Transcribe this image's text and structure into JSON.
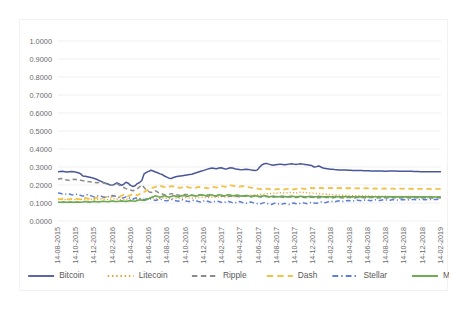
{
  "chart_data": {
    "type": "line",
    "title": "",
    "subtitle": "",
    "xlabel": "",
    "ylabel": "",
    "ylim": [
      0.0,
      1.0
    ],
    "ytick_step": 0.1,
    "grid": true,
    "legend_position": "bottom",
    "y_ticks": [
      "0.0000",
      "0.1000",
      "0.2000",
      "0.3000",
      "0.4000",
      "0.5000",
      "0.6000",
      "0.7000",
      "0.8000",
      "0.9000",
      "1.0000"
    ],
    "x_ticks": [
      "14-08-2015",
      "14-10-2015",
      "14-12-2015",
      "14-02-2016",
      "14-04-2016",
      "14-06-2016",
      "14-08-2016",
      "14-10-2016",
      "14-12-2016",
      "14-02-2017",
      "14-04-2017",
      "14-06-2017",
      "14-08-2017",
      "14-10-2017",
      "14-12-2017",
      "14-02-2018",
      "14-04-2018",
      "14-06-2018",
      "14-08-2018",
      "14-10-2018",
      "14-12-2018",
      "14-02-2019"
    ],
    "x_range": [
      "14-08-2015",
      "14-02-2019"
    ],
    "series": [
      {
        "name": "Bitcoin",
        "color": "#4a5699",
        "style": "solid",
        "width": 1.5,
        "values": [
          0.274,
          0.275,
          0.276,
          0.274,
          0.272,
          0.274,
          0.275,
          0.273,
          0.271,
          0.268,
          0.262,
          0.25,
          0.248,
          0.246,
          0.243,
          0.24,
          0.236,
          0.232,
          0.226,
          0.22,
          0.214,
          0.21,
          0.206,
          0.2,
          0.198,
          0.205,
          0.212,
          0.206,
          0.198,
          0.204,
          0.215,
          0.21,
          0.198,
          0.192,
          0.196,
          0.208,
          0.214,
          0.225,
          0.262,
          0.27,
          0.276,
          0.282,
          0.278,
          0.272,
          0.268,
          0.262,
          0.258,
          0.25,
          0.244,
          0.238,
          0.236,
          0.242,
          0.246,
          0.248,
          0.25,
          0.252,
          0.254,
          0.256,
          0.258,
          0.26,
          0.264,
          0.268,
          0.272,
          0.276,
          0.28,
          0.284,
          0.288,
          0.292,
          0.294,
          0.292,
          0.29,
          0.294,
          0.296,
          0.292,
          0.288,
          0.292,
          0.296,
          0.294,
          0.29,
          0.288,
          0.286,
          0.284,
          0.286,
          0.288,
          0.286,
          0.284,
          0.282,
          0.28,
          0.284,
          0.3,
          0.312,
          0.318,
          0.32,
          0.316,
          0.312,
          0.31,
          0.312,
          0.314,
          0.316,
          0.314,
          0.312,
          0.314,
          0.316,
          0.318,
          0.316,
          0.314,
          0.316,
          0.318,
          0.316,
          0.314,
          0.312,
          0.31,
          0.308,
          0.3,
          0.302,
          0.306,
          0.3,
          0.294,
          0.292,
          0.29,
          0.288,
          0.288,
          0.286,
          0.285,
          0.284,
          0.284,
          0.283,
          0.283,
          0.282,
          0.282,
          0.281,
          0.281,
          0.28,
          0.28,
          0.28,
          0.279,
          0.279,
          0.279,
          0.278,
          0.278,
          0.278,
          0.278,
          0.278,
          0.278,
          0.277,
          0.277,
          0.278,
          0.278,
          0.278,
          0.278,
          0.277,
          0.277,
          0.277,
          0.276,
          0.276,
          0.276,
          0.276,
          0.275,
          0.275,
          0.275,
          0.274,
          0.274,
          0.274,
          0.274,
          0.273,
          0.273,
          0.273,
          0.273,
          0.273,
          0.273
        ]
      },
      {
        "name": "Litecoin",
        "color": "#e8a33d",
        "style": "dotted",
        "width": 1.4,
        "values": [
          0.122,
          0.12,
          0.121,
          0.119,
          0.118,
          0.12,
          0.122,
          0.12,
          0.118,
          0.119,
          0.121,
          0.12,
          0.118,
          0.117,
          0.119,
          0.121,
          0.119,
          0.118,
          0.12,
          0.122,
          0.12,
          0.118,
          0.119,
          0.121,
          0.122,
          0.124,
          0.122,
          0.12,
          0.118,
          0.12,
          0.122,
          0.121,
          0.119,
          0.118,
          0.12,
          0.122,
          0.121,
          0.12,
          0.122,
          0.124,
          0.126,
          0.128,
          0.127,
          0.125,
          0.124,
          0.126,
          0.128,
          0.127,
          0.126,
          0.125,
          0.124,
          0.126,
          0.128,
          0.127,
          0.126,
          0.128,
          0.13,
          0.129,
          0.128,
          0.127,
          0.126,
          0.128,
          0.13,
          0.132,
          0.131,
          0.13,
          0.129,
          0.131,
          0.133,
          0.132,
          0.131,
          0.133,
          0.135,
          0.134,
          0.133,
          0.135,
          0.137,
          0.136,
          0.135,
          0.137,
          0.139,
          0.138,
          0.14,
          0.142,
          0.141,
          0.143,
          0.145,
          0.144,
          0.146,
          0.148,
          0.15,
          0.149,
          0.151,
          0.153,
          0.152,
          0.154,
          0.156,
          0.155,
          0.157,
          0.156,
          0.155,
          0.157,
          0.159,
          0.158,
          0.157,
          0.156,
          0.158,
          0.16,
          0.159,
          0.158,
          0.157,
          0.156,
          0.155,
          0.154,
          0.153,
          0.152,
          0.151,
          0.15,
          0.149,
          0.148,
          0.147,
          0.146,
          0.145,
          0.144,
          0.144,
          0.143,
          0.143,
          0.142,
          0.142,
          0.141,
          0.141,
          0.141,
          0.14,
          0.14,
          0.14,
          0.14,
          0.139,
          0.139,
          0.139,
          0.139,
          0.138,
          0.138,
          0.138,
          0.138,
          0.138,
          0.138,
          0.137,
          0.137,
          0.137,
          0.137,
          0.137,
          0.137,
          0.136,
          0.136,
          0.136,
          0.136,
          0.136,
          0.136,
          0.136,
          0.135,
          0.135,
          0.135,
          0.135,
          0.135,
          0.135,
          0.135,
          0.135,
          0.134,
          0.134,
          0.134
        ]
      },
      {
        "name": "Ripple",
        "color": "#8c8c8c",
        "style": "dashed",
        "width": 1.5,
        "values": [
          0.232,
          0.236,
          0.234,
          0.23,
          0.228,
          0.226,
          0.229,
          0.232,
          0.23,
          0.228,
          0.226,
          0.224,
          0.222,
          0.22,
          0.218,
          0.216,
          0.214,
          0.212,
          0.214,
          0.216,
          0.212,
          0.208,
          0.204,
          0.2,
          0.198,
          0.202,
          0.206,
          0.2,
          0.192,
          0.186,
          0.18,
          0.176,
          0.172,
          0.168,
          0.172,
          0.18,
          0.19,
          0.2,
          0.186,
          0.172,
          0.164,
          0.158,
          0.162,
          0.168,
          0.16,
          0.154,
          0.15,
          0.146,
          0.144,
          0.148,
          0.152,
          0.15,
          0.146,
          0.144,
          0.142,
          0.145,
          0.148,
          0.146,
          0.144,
          0.142,
          0.14,
          0.143,
          0.146,
          0.144,
          0.142,
          0.14,
          0.138,
          0.14,
          0.142,
          0.14,
          0.138,
          0.136,
          0.138,
          0.14,
          0.138,
          0.136,
          0.138,
          0.14,
          0.138,
          0.136,
          0.135,
          0.137,
          0.139,
          0.137,
          0.135,
          0.134,
          0.136,
          0.138,
          0.136,
          0.134,
          0.133,
          0.135,
          0.137,
          0.135,
          0.133,
          0.132,
          0.134,
          0.136,
          0.134,
          0.132,
          0.131,
          0.133,
          0.135,
          0.133,
          0.131,
          0.13,
          0.132,
          0.134,
          0.132,
          0.13,
          0.129,
          0.131,
          0.133,
          0.131,
          0.13,
          0.129,
          0.131,
          0.133,
          0.131,
          0.13,
          0.129,
          0.128,
          0.13,
          0.132,
          0.13,
          0.129,
          0.128,
          0.13,
          0.131,
          0.13,
          0.129,
          0.128,
          0.13,
          0.131,
          0.13,
          0.129,
          0.128,
          0.129,
          0.131,
          0.13,
          0.129,
          0.128,
          0.129,
          0.13,
          0.129,
          0.128,
          0.128,
          0.129,
          0.13,
          0.129,
          0.128,
          0.128,
          0.129,
          0.13,
          0.129,
          0.128,
          0.128,
          0.129,
          0.13,
          0.129,
          0.128,
          0.128,
          0.129,
          0.129,
          0.128,
          0.128,
          0.128,
          0.129,
          0.129,
          0.128
        ]
      },
      {
        "name": "Dash",
        "color": "#f0c246",
        "style": "dashed",
        "width": 1.8,
        "values": [
          0.122,
          0.12,
          0.124,
          0.126,
          0.122,
          0.12,
          0.123,
          0.126,
          0.124,
          0.122,
          0.12,
          0.124,
          0.128,
          0.126,
          0.124,
          0.122,
          0.126,
          0.13,
          0.128,
          0.126,
          0.13,
          0.134,
          0.132,
          0.13,
          0.136,
          0.142,
          0.138,
          0.134,
          0.14,
          0.146,
          0.142,
          0.138,
          0.144,
          0.15,
          0.146,
          0.142,
          0.15,
          0.158,
          0.162,
          0.168,
          0.175,
          0.182,
          0.186,
          0.19,
          0.194,
          0.196,
          0.192,
          0.188,
          0.186,
          0.19,
          0.194,
          0.192,
          0.188,
          0.186,
          0.184,
          0.188,
          0.192,
          0.19,
          0.186,
          0.184,
          0.182,
          0.186,
          0.19,
          0.188,
          0.186,
          0.184,
          0.182,
          0.186,
          0.19,
          0.188,
          0.186,
          0.19,
          0.194,
          0.192,
          0.19,
          0.194,
          0.198,
          0.196,
          0.194,
          0.192,
          0.19,
          0.194,
          0.192,
          0.19,
          0.188,
          0.186,
          0.184,
          0.182,
          0.18,
          0.178,
          0.176,
          0.178,
          0.18,
          0.178,
          0.176,
          0.174,
          0.176,
          0.178,
          0.176,
          0.174,
          0.176,
          0.178,
          0.18,
          0.178,
          0.176,
          0.178,
          0.18,
          0.182,
          0.18,
          0.178,
          0.18,
          0.182,
          0.184,
          0.182,
          0.18,
          0.182,
          0.184,
          0.182,
          0.18,
          0.182,
          0.184,
          0.182,
          0.18,
          0.182,
          0.184,
          0.182,
          0.18,
          0.182,
          0.183,
          0.182,
          0.18,
          0.181,
          0.182,
          0.181,
          0.18,
          0.181,
          0.182,
          0.181,
          0.18,
          0.18,
          0.181,
          0.18,
          0.179,
          0.18,
          0.181,
          0.18,
          0.179,
          0.18,
          0.18,
          0.179,
          0.179,
          0.18,
          0.18,
          0.179,
          0.178,
          0.179,
          0.18,
          0.179,
          0.178,
          0.178,
          0.179,
          0.178,
          0.178,
          0.178,
          0.178,
          0.177,
          0.177,
          0.178,
          0.178,
          0.177
        ]
      },
      {
        "name": "Stellar",
        "color": "#5b7fd4",
        "style": "dashdot",
        "width": 1.5,
        "values": [
          0.156,
          0.154,
          0.15,
          0.148,
          0.152,
          0.15,
          0.146,
          0.144,
          0.148,
          0.146,
          0.142,
          0.138,
          0.142,
          0.146,
          0.142,
          0.138,
          0.134,
          0.138,
          0.142,
          0.138,
          0.134,
          0.13,
          0.134,
          0.138,
          0.142,
          0.138,
          0.134,
          0.13,
          0.126,
          0.13,
          0.134,
          0.13,
          0.126,
          0.122,
          0.126,
          0.13,
          0.126,
          0.122,
          0.118,
          0.122,
          0.126,
          0.122,
          0.118,
          0.114,
          0.118,
          0.122,
          0.118,
          0.114,
          0.112,
          0.116,
          0.12,
          0.116,
          0.112,
          0.11,
          0.114,
          0.118,
          0.114,
          0.11,
          0.108,
          0.112,
          0.116,
          0.112,
          0.108,
          0.106,
          0.11,
          0.114,
          0.11,
          0.106,
          0.104,
          0.108,
          0.112,
          0.108,
          0.104,
          0.102,
          0.106,
          0.11,
          0.106,
          0.102,
          0.1,
          0.104,
          0.108,
          0.104,
          0.1,
          0.098,
          0.102,
          0.106,
          0.102,
          0.098,
          0.096,
          0.094,
          0.098,
          0.102,
          0.098,
          0.094,
          0.092,
          0.096,
          0.1,
          0.096,
          0.092,
          0.094,
          0.098,
          0.094,
          0.092,
          0.096,
          0.1,
          0.096,
          0.094,
          0.098,
          0.102,
          0.098,
          0.096,
          0.1,
          0.104,
          0.1,
          0.098,
          0.102,
          0.106,
          0.104,
          0.102,
          0.106,
          0.11,
          0.108,
          0.106,
          0.11,
          0.112,
          0.11,
          0.108,
          0.112,
          0.114,
          0.112,
          0.11,
          0.114,
          0.116,
          0.114,
          0.112,
          0.115,
          0.117,
          0.115,
          0.113,
          0.116,
          0.118,
          0.116,
          0.114,
          0.117,
          0.119,
          0.117,
          0.115,
          0.117,
          0.119,
          0.117,
          0.116,
          0.118,
          0.12,
          0.118,
          0.117,
          0.118,
          0.12,
          0.119,
          0.118,
          0.119,
          0.12,
          0.119,
          0.118,
          0.119,
          0.12,
          0.119,
          0.119,
          0.12,
          0.121,
          0.12
        ]
      },
      {
        "name": "Monero",
        "color": "#6ba84f",
        "style": "solid",
        "width": 1.6,
        "values": [
          0.105,
          0.104,
          0.106,
          0.105,
          0.104,
          0.106,
          0.105,
          0.104,
          0.106,
          0.105,
          0.104,
          0.106,
          0.108,
          0.106,
          0.105,
          0.107,
          0.109,
          0.107,
          0.106,
          0.108,
          0.11,
          0.108,
          0.107,
          0.109,
          0.111,
          0.109,
          0.108,
          0.11,
          0.112,
          0.11,
          0.109,
          0.111,
          0.113,
          0.111,
          0.11,
          0.114,
          0.118,
          0.116,
          0.114,
          0.118,
          0.124,
          0.13,
          0.134,
          0.14,
          0.136,
          0.132,
          0.136,
          0.14,
          0.136,
          0.132,
          0.136,
          0.14,
          0.138,
          0.134,
          0.138,
          0.142,
          0.14,
          0.136,
          0.14,
          0.144,
          0.142,
          0.138,
          0.142,
          0.146,
          0.144,
          0.14,
          0.144,
          0.146,
          0.144,
          0.14,
          0.142,
          0.146,
          0.144,
          0.14,
          0.142,
          0.146,
          0.144,
          0.14,
          0.142,
          0.144,
          0.142,
          0.138,
          0.14,
          0.142,
          0.14,
          0.136,
          0.138,
          0.14,
          0.138,
          0.136,
          0.138,
          0.14,
          0.138,
          0.134,
          0.136,
          0.138,
          0.136,
          0.134,
          0.136,
          0.138,
          0.136,
          0.134,
          0.136,
          0.138,
          0.136,
          0.134,
          0.136,
          0.137,
          0.136,
          0.134,
          0.135,
          0.137,
          0.136,
          0.134,
          0.135,
          0.137,
          0.136,
          0.134,
          0.135,
          0.136,
          0.135,
          0.134,
          0.135,
          0.136,
          0.135,
          0.134,
          0.135,
          0.136,
          0.135,
          0.134,
          0.134,
          0.135,
          0.135,
          0.134,
          0.134,
          0.135,
          0.135,
          0.134,
          0.134,
          0.135,
          0.135,
          0.134,
          0.134,
          0.135,
          0.135,
          0.134,
          0.134,
          0.134,
          0.135,
          0.134,
          0.134,
          0.134,
          0.135,
          0.134,
          0.134,
          0.134,
          0.134,
          0.134,
          0.134,
          0.134,
          0.134,
          0.134,
          0.134,
          0.133,
          0.134,
          0.134,
          0.133,
          0.133,
          0.134,
          0.133
        ]
      }
    ],
    "legend": [
      {
        "label": "Bitcoin",
        "color": "#4a5699",
        "style": "solid"
      },
      {
        "label": "Litecoin",
        "color": "#e8a33d",
        "style": "dotted"
      },
      {
        "label": "Ripple",
        "color": "#8c8c8c",
        "style": "dashed"
      },
      {
        "label": "Dash",
        "color": "#f0c246",
        "style": "dashed"
      },
      {
        "label": "Stellar",
        "color": "#5b7fd4",
        "style": "dashdot"
      },
      {
        "label": "Monero",
        "color": "#6ba84f",
        "style": "solid"
      }
    ]
  },
  "colors": {
    "gridline": "#e9e9e9",
    "tick_text": "#6b6b6b",
    "legend_text": "#5a5a5a",
    "card_border": "#f2f2f2",
    "background": "#ffffff"
  }
}
